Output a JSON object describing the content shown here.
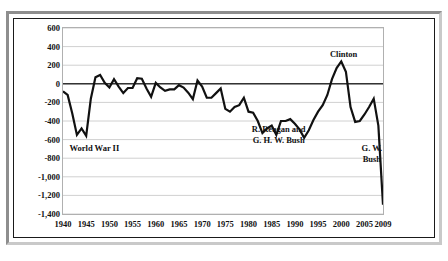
{
  "chart_data": {
    "type": "line",
    "title": "(in billions)",
    "xlabel": "",
    "ylabel": "",
    "xlim": [
      1940,
      2009
    ],
    "ylim": [
      -1400,
      600
    ],
    "grid": true,
    "legend": "none",
    "y_ticks": [
      "600",
      "400",
      "200",
      "0",
      "-200",
      "-400",
      "-600",
      "-800",
      "-1,000",
      "-1,200",
      "-1,400"
    ],
    "y_tick_values": [
      600,
      400,
      200,
      0,
      -200,
      -400,
      -600,
      -800,
      -1000,
      -1200,
      -1400
    ],
    "x_ticks": [
      "1940",
      "1945",
      "1950",
      "1955",
      "1960",
      "1965",
      "1970",
      "1975",
      "1980",
      "1985",
      "1990",
      "1995",
      "2000",
      "2005",
      "2009"
    ],
    "x_tick_values": [
      1940,
      1945,
      1950,
      1955,
      1960,
      1965,
      1970,
      1975,
      1980,
      1985,
      1990,
      1995,
      2000,
      2005,
      2009
    ],
    "series": [
      {
        "name": "Federal surplus or deficit",
        "x": [
          1940,
          1941,
          1942,
          1943,
          1944,
          1945,
          1946,
          1947,
          1948,
          1949,
          1950,
          1951,
          1952,
          1953,
          1954,
          1955,
          1956,
          1957,
          1958,
          1959,
          1960,
          1961,
          1962,
          1963,
          1964,
          1965,
          1966,
          1967,
          1968,
          1969,
          1970,
          1971,
          1972,
          1973,
          1974,
          1975,
          1976,
          1977,
          1978,
          1979,
          1980,
          1981,
          1982,
          1983,
          1984,
          1985,
          1986,
          1987,
          1988,
          1989,
          1990,
          1991,
          1992,
          1993,
          1994,
          1995,
          1996,
          1997,
          1998,
          1999,
          2000,
          2001,
          2002,
          2003,
          2004,
          2005,
          2006,
          2007,
          2008,
          2009
        ],
        "values": [
          -80,
          -120,
          -320,
          -550,
          -480,
          -560,
          -160,
          70,
          95,
          10,
          -40,
          50,
          -30,
          -100,
          -45,
          -45,
          60,
          55,
          -50,
          -140,
          10,
          -40,
          -75,
          -60,
          -60,
          -15,
          -40,
          -95,
          -165,
          35,
          -30,
          -150,
          -150,
          -100,
          -50,
          -270,
          -300,
          -250,
          -230,
          -150,
          -300,
          -310,
          -400,
          -530,
          -480,
          -450,
          -550,
          -400,
          -400,
          -380,
          -430,
          -490,
          -580,
          -500,
          -390,
          -300,
          -230,
          -120,
          50,
          170,
          240,
          130,
          -250,
          -410,
          -400,
          -330,
          -250,
          -160,
          -450,
          -1300
        ]
      }
    ],
    "annotations": [
      {
        "id": "world-war-ii",
        "text": "World War II"
      },
      {
        "id": "reagan-bush-line1",
        "text": "R. Reagan and"
      },
      {
        "id": "reagan-bush-line2",
        "text": "G. H. W. Bush"
      },
      {
        "id": "clinton",
        "text": "Clinton"
      },
      {
        "id": "gw-bush-line1",
        "text": "G. W."
      },
      {
        "id": "gw-bush-line2",
        "text": "Bush"
      }
    ],
    "colors": {
      "line": "#111111",
      "grid": "#d0d0d0",
      "zero_axis": "#333333",
      "plot_border": "#b0b0b0",
      "text": "#111111"
    }
  }
}
